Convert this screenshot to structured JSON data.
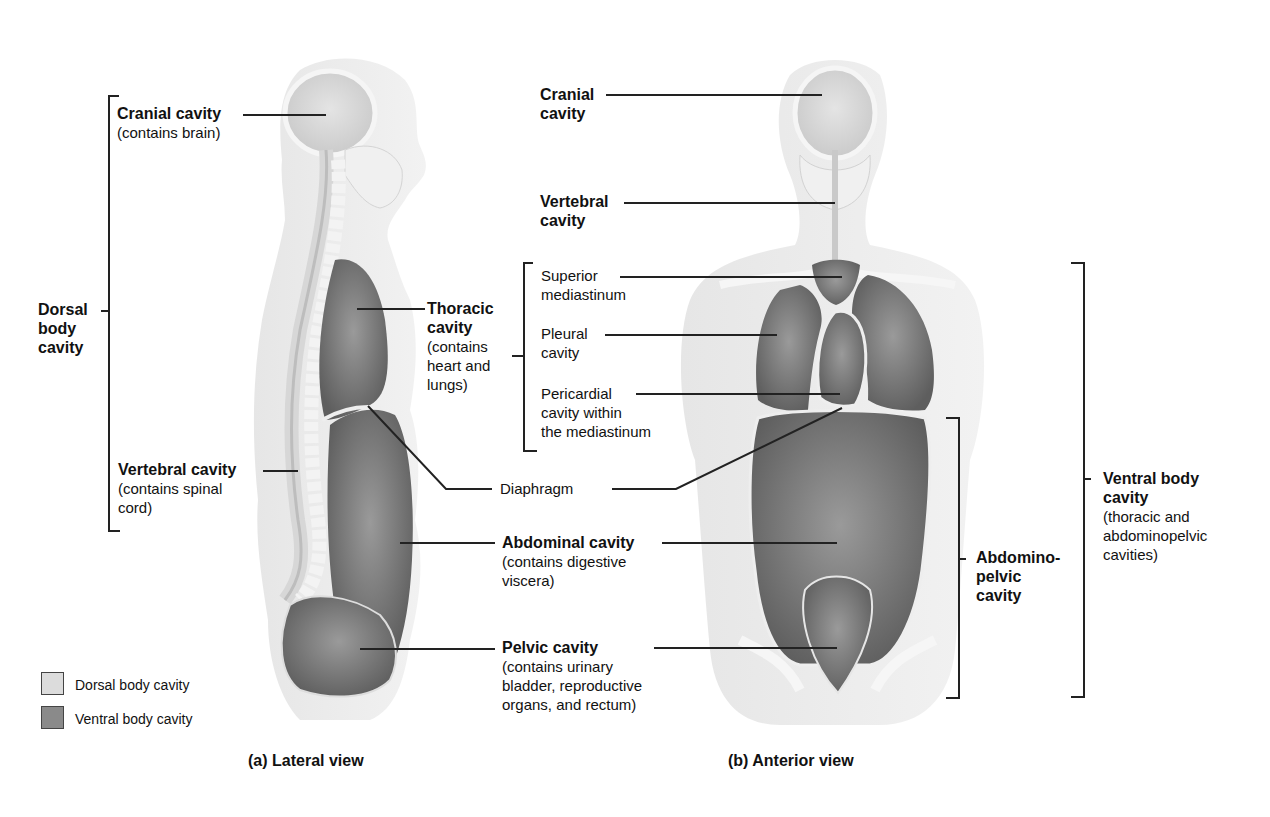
{
  "colors": {
    "dorsal_cavity": "#dcdcdc",
    "ventral_cavity": "#8a8a8a",
    "body_outline": "#e9e9e9",
    "bone": "#f3f3f3",
    "line": "#222222"
  },
  "lateral_view": {
    "caption": "(a) Lateral view",
    "dorsal_group": {
      "title_lines": [
        "Dorsal",
        "body",
        "cavity"
      ]
    },
    "cranial": {
      "title": "Cranial cavity",
      "desc": "(contains brain)"
    },
    "vertebral": {
      "title": "Vertebral cavity",
      "desc_lines": [
        "(contains spinal",
        "cord)"
      ]
    },
    "thoracic": {
      "title_lines": [
        "Thoracic",
        "cavity"
      ],
      "desc_lines": [
        "(contains",
        "heart and",
        "lungs)"
      ]
    },
    "diaphragm": "Diaphragm",
    "abdominal": {
      "title": "Abdominal cavity",
      "desc_lines": [
        "(contains digestive",
        "viscera)"
      ]
    },
    "pelvic": {
      "title": "Pelvic cavity",
      "desc_lines": [
        "(contains urinary",
        "bladder, reproductive",
        "organs, and rectum)"
      ]
    }
  },
  "thoracic_subdivisions": [
    {
      "lines": [
        "Superior",
        "mediastinum"
      ]
    },
    {
      "lines": [
        "Pleural",
        "cavity"
      ]
    },
    {
      "lines": [
        "Pericardial",
        "cavity within",
        "the mediastinum"
      ]
    }
  ],
  "anterior_view": {
    "caption": "(b) Anterior view",
    "cranial": {
      "title_lines": [
        "Cranial",
        "cavity"
      ]
    },
    "vertebral": {
      "title_lines": [
        "Vertebral",
        "cavity"
      ]
    },
    "abdominopelvic": {
      "title_lines": [
        "Abdomino-",
        "pelvic",
        "cavity"
      ]
    },
    "ventral": {
      "title_lines": [
        "Ventral body",
        "cavity"
      ],
      "desc_lines": [
        "(thoracic and",
        "abdominopelvic",
        "cavities)"
      ]
    }
  },
  "legend": [
    {
      "label": "Dorsal body cavity",
      "swatch": "dorsal"
    },
    {
      "label": "Ventral body cavity",
      "swatch": "ventral"
    }
  ]
}
